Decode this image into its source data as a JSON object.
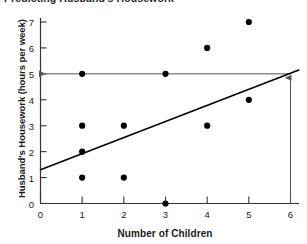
{
  "chart_data": {
    "type": "scatter",
    "title": "Predicting Husband's Housework",
    "xlabel": "Number of Children",
    "ylabel": "Husband's Housework (hours per week)",
    "xlim": [
      0,
      6
    ],
    "ylim": [
      0,
      7
    ],
    "xticks": [
      0,
      1,
      2,
      3,
      4,
      5,
      6
    ],
    "yticks": [
      0,
      1,
      2,
      3,
      4,
      5,
      6,
      7
    ],
    "xtick_labels": [
      "0",
      "1",
      "2",
      "3",
      "4",
      "5",
      "6"
    ],
    "ytick_labels": [
      "0",
      "1",
      "2",
      "3",
      "4",
      "5",
      "6",
      "7"
    ],
    "grid": false,
    "legend": null,
    "series": [
      {
        "name": "Observations",
        "marker": "filled-circle",
        "color": "#000000",
        "points": [
          {
            "x": 1,
            "y": 5
          },
          {
            "x": 1,
            "y": 3
          },
          {
            "x": 1,
            "y": 2
          },
          {
            "x": 1,
            "y": 1
          },
          {
            "x": 2,
            "y": 3
          },
          {
            "x": 2,
            "y": 1
          },
          {
            "x": 3,
            "y": 5
          },
          {
            "x": 3,
            "y": 0
          },
          {
            "x": 4,
            "y": 6
          },
          {
            "x": 4,
            "y": 3
          },
          {
            "x": 5,
            "y": 7
          },
          {
            "x": 5,
            "y": 4
          }
        ]
      }
    ],
    "trendline": {
      "name": "Regression line",
      "color": "#000000",
      "x_start": 0,
      "y_start": 1.3,
      "x_end": 6.2,
      "y_end": 5.15
    },
    "annotations": [
      {
        "name": "prediction-horizontal-line",
        "type": "horizontal-line",
        "y": 5,
        "x_from": 6,
        "x_to": 0,
        "arrow_at": "left",
        "color": "#555555"
      },
      {
        "name": "prediction-vertical-arrow",
        "type": "vertical-line",
        "x": 6,
        "y_from": 0,
        "y_to": 5,
        "arrow_at": "top",
        "color": "#555555"
      }
    ]
  },
  "axes": {
    "y_title": "Husband's Housework (hours per week)",
    "x_title": "Number of Children"
  }
}
